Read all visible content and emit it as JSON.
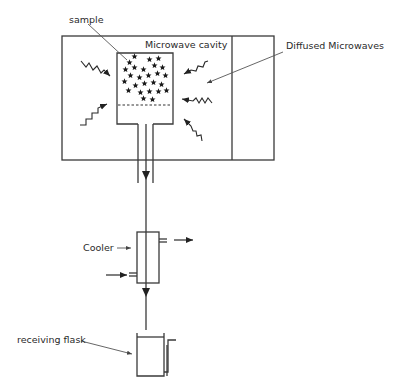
{
  "diagram": {
    "type": "microwave-assisted extraction / hydrodiffusion apparatus",
    "labels": {
      "sample": "sample",
      "cavity": "Microwave cavity",
      "diffused": "Diffused Microwaves",
      "cooler": "Cooler",
      "flask": "receiving flask"
    },
    "components": [
      {
        "id": "microwave-oven",
        "name": "Microwave oven enclosure"
      },
      {
        "id": "sample-vessel",
        "name": "Sample vessel with perforated support (dashed)"
      },
      {
        "id": "outlet-tube",
        "name": "Outlet tube with downward flow arrow"
      },
      {
        "id": "cooler",
        "name": "Cooler (condenser) with coolant inlet and outlet"
      },
      {
        "id": "receiving-flask",
        "name": "Receiving flask with side arm"
      }
    ],
    "colors": {
      "stroke": "#3a3a3a",
      "text": "#2a2a2a",
      "background": "#ffffff"
    }
  }
}
